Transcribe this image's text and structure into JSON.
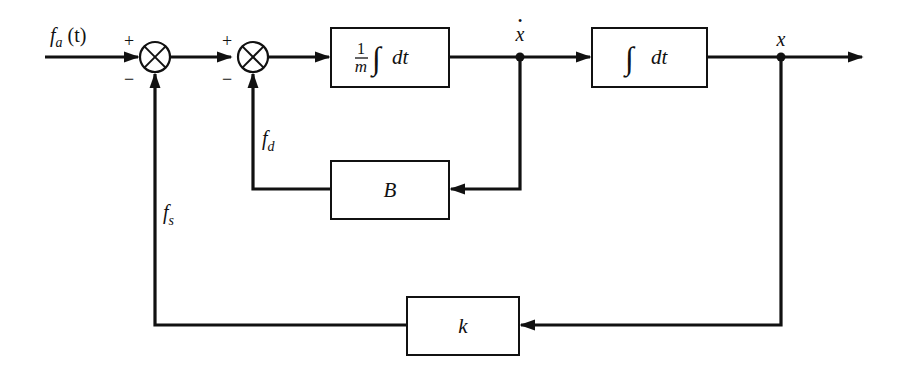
{
  "diagram": {
    "type": "block-diagram",
    "input_signal": {
      "name": "f",
      "subscript": "a",
      "suffix": " (t)"
    },
    "summing_junctions": [
      {
        "id": "sum1",
        "plus": "+",
        "minus": "−"
      },
      {
        "id": "sum2",
        "plus": "+",
        "minus": "−"
      }
    ],
    "blocks": {
      "mass_integrator": {
        "numerator": "1",
        "denominator": "m",
        "integral": "∫",
        "dt": "dt"
      },
      "integrator": {
        "integral": "∫",
        "dt": "dt"
      },
      "damper": {
        "label": "B"
      },
      "spring": {
        "label": "k"
      }
    },
    "signals": {
      "velocity": {
        "label": "x",
        "dot": "•"
      },
      "position": {
        "label": "x"
      },
      "damping_force": {
        "name": "f",
        "subscript": "d"
      },
      "spring_force": {
        "name": "f",
        "subscript": "s"
      }
    }
  }
}
